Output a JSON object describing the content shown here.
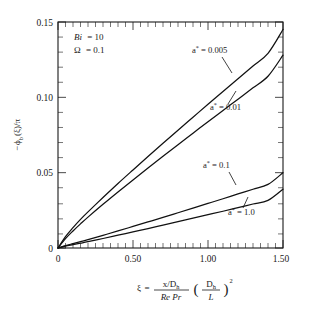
{
  "chart_data": {
    "type": "line",
    "title": "",
    "subtitle": "",
    "xlabel": "ξ = (x/D_h)/(Re Pr) (D_h/L)^2",
    "ylabel": "−ϕ_b(ξ)/π",
    "xlim": [
      0,
      1.5
    ],
    "ylim": [
      0,
      0.15
    ],
    "xticks": [
      0,
      0.5,
      1.0,
      1.5
    ],
    "xticklabels": [
      "0",
      "0.50",
      "1.00",
      "1.50"
    ],
    "yticks": [
      0,
      0.05,
      0.1,
      0.15
    ],
    "yticklabels": [
      "0",
      "0.05",
      "0.10",
      "0.15"
    ],
    "grid": false,
    "legend_position": "inline-annotations",
    "minor_ticks": true,
    "x": [
      0,
      0.05,
      0.1,
      0.15,
      0.2,
      0.3,
      0.4,
      0.5,
      0.6,
      0.7,
      0.8,
      0.9,
      1.0,
      1.1,
      1.2,
      1.3,
      1.4,
      1.5
    ],
    "series": [
      {
        "name": "a* = 0.005",
        "label": "a* = 0.005",
        "values": [
          0,
          0.0075,
          0.0135,
          0.019,
          0.024,
          0.0335,
          0.0428,
          0.0518,
          0.0607,
          0.0695,
          0.0782,
          0.0868,
          0.0954,
          0.1039,
          0.1124,
          0.1208,
          0.1292,
          0.145
        ]
      },
      {
        "name": "a* = 0.01",
        "label": "a* = 0.01",
        "values": [
          0,
          0.0062,
          0.0113,
          0.016,
          0.0205,
          0.029,
          0.0372,
          0.0452,
          0.0531,
          0.0609,
          0.0686,
          0.0762,
          0.0838,
          0.0913,
          0.0988,
          0.1063,
          0.114,
          0.128
        ]
      },
      {
        "name": "a* = 0.1",
        "label": "a* = 0.1",
        "values": [
          0,
          0.0016,
          0.0029,
          0.0042,
          0.0055,
          0.0084,
          0.0113,
          0.0143,
          0.0173,
          0.0203,
          0.0234,
          0.0265,
          0.0296,
          0.0327,
          0.0359,
          0.039,
          0.0422,
          0.05
        ]
      },
      {
        "name": "a* = 1.0",
        "label": "a* = 1.0",
        "values": [
          0,
          0.0012,
          0.0022,
          0.0032,
          0.0042,
          0.0063,
          0.0085,
          0.0107,
          0.0129,
          0.0152,
          0.0175,
          0.0198,
          0.0221,
          0.0244,
          0.0268,
          0.0292,
          0.0316,
          0.039
        ]
      }
    ],
    "annotations": [
      {
        "name": "biot-number",
        "text": "Bi = 10",
        "symbol": "Bi",
        "value": "10"
      },
      {
        "name": "omega-parameter",
        "text": "Ω = 0.1",
        "symbol": "Ω",
        "value": "0.1"
      }
    ]
  },
  "axis": {
    "y_label_parts": {
      "minus": "−",
      "phi": "ϕ",
      "sub": "b",
      "arg": "(ξ)",
      "div": "/π"
    },
    "x_label_parts": {
      "xi": "ξ",
      "equals": "=",
      "num": "x/D",
      "num_sub": "h",
      "den": "Re Pr",
      "paren_num": "D",
      "paren_num_sub": "h",
      "paren_den": "L",
      "exp": "2"
    }
  },
  "labels": {
    "xticks": [
      "0",
      "0.50",
      "1.00",
      "1.50"
    ],
    "yticks": [
      "0",
      "0.05",
      "0.10",
      "0.15"
    ],
    "annot_bi_sym": "Bi",
    "annot_bi_eq": "= 10",
    "annot_om_sym": "Ω",
    "annot_om_eq": "= 0.1",
    "series": [
      "a",
      "a",
      "a",
      "a"
    ],
    "series_star": "*",
    "series_eq": [
      "= 0.005",
      "= 0.01",
      "= 0.1",
      "= 1.0"
    ]
  }
}
